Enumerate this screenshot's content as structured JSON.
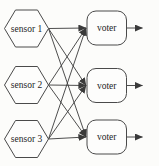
{
  "diagram": {
    "canvas": {
      "width": 159,
      "height": 166
    },
    "colors": {
      "background": "#fcfcfa",
      "node_fill": "#fdfdfc",
      "node_stroke": "#4a4a4a",
      "edge_stroke": "#3a3a3a",
      "text": "#1e1e1e"
    },
    "hex_geometry": {
      "half_w": 22,
      "half_h": 18.5,
      "top_half_w": 11
    },
    "sensors": [
      {
        "id": "sensor-1",
        "label": "sensor 1",
        "cx": 26.5,
        "cy": 28.5
      },
      {
        "id": "sensor-2",
        "label": "sensor 2",
        "cx": 26.5,
        "cy": 85
      },
      {
        "id": "sensor-3",
        "label": "sensor 3",
        "cx": 26.5,
        "cy": 139
      }
    ],
    "voters": [
      {
        "id": "voter-1",
        "label": "voter",
        "x": 87,
        "y": 11,
        "w": 39.5,
        "h": 34,
        "rx": 9
      },
      {
        "id": "voter-2",
        "label": "voter",
        "x": 87,
        "y": 68.5,
        "w": 39.5,
        "h": 34,
        "rx": 9
      },
      {
        "id": "voter-3",
        "label": "voter",
        "x": 87,
        "y": 120,
        "w": 39.5,
        "h": 34,
        "rx": 9
      }
    ],
    "edges": [
      {
        "from": "sensor-1",
        "to": "voter-1"
      },
      {
        "from": "sensor-1",
        "to": "voter-2"
      },
      {
        "from": "sensor-1",
        "to": "voter-3"
      },
      {
        "from": "sensor-2",
        "to": "voter-1"
      },
      {
        "from": "sensor-2",
        "to": "voter-2"
      },
      {
        "from": "sensor-2",
        "to": "voter-3"
      },
      {
        "from": "sensor-3",
        "to": "voter-1"
      },
      {
        "from": "sensor-3",
        "to": "voter-2"
      },
      {
        "from": "sensor-3",
        "to": "voter-3"
      }
    ],
    "outputs": [
      {
        "from": "voter-1",
        "length": 16
      },
      {
        "from": "voter-2",
        "length": 16
      },
      {
        "from": "voter-3",
        "length": 16
      }
    ],
    "label_font_size": 9.5
  }
}
